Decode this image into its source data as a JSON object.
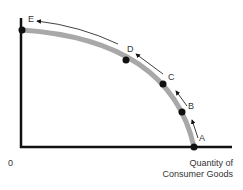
{
  "diagram": {
    "origin_label": "0",
    "x_axis_label_line1": "Quantity of",
    "x_axis_label_line2": "Consumer Goods",
    "curve_color": "#a8a8a8",
    "axis_color": "#111111",
    "points": [
      {
        "label": "A",
        "x": 194,
        "y": 147
      },
      {
        "label": "B",
        "x": 182,
        "y": 112
      },
      {
        "label": "C",
        "x": 163,
        "y": 84
      },
      {
        "label": "D",
        "x": 126,
        "y": 60
      },
      {
        "label": "E",
        "x": 22,
        "y": 30
      }
    ]
  }
}
